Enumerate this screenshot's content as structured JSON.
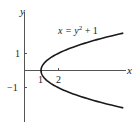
{
  "chart_data": {
    "type": "line",
    "title": "",
    "xlabel": "x",
    "ylabel": "y",
    "annotation": "x = y² + 1",
    "annotation_parts": {
      "lhs": "x = y",
      "exp": "2",
      "rhs": " + 1"
    },
    "x_ticks": [
      1,
      2
    ],
    "x_tick_labels": [
      "1",
      "2"
    ],
    "y_ticks": [
      1,
      -1
    ],
    "y_tick_labels": [
      "1",
      "−1"
    ],
    "series": [
      {
        "name": "x = y^2 + 1",
        "y": [
          -2.2,
          -2.0,
          -1.5,
          -1.0,
          -0.5,
          0,
          0.5,
          1.0,
          1.5,
          2.0,
          2.2
        ],
        "x": [
          5.84,
          5.0,
          3.25,
          2.0,
          1.25,
          1.0,
          1.25,
          2.0,
          3.25,
          5.0,
          5.84
        ]
      }
    ],
    "xlim": [
      0,
      6
    ],
    "ylim": [
      -3,
      3.4
    ],
    "grid": false,
    "legend": "none",
    "colors": {
      "curve": "#1a1a1a",
      "axes": "#555555"
    }
  }
}
